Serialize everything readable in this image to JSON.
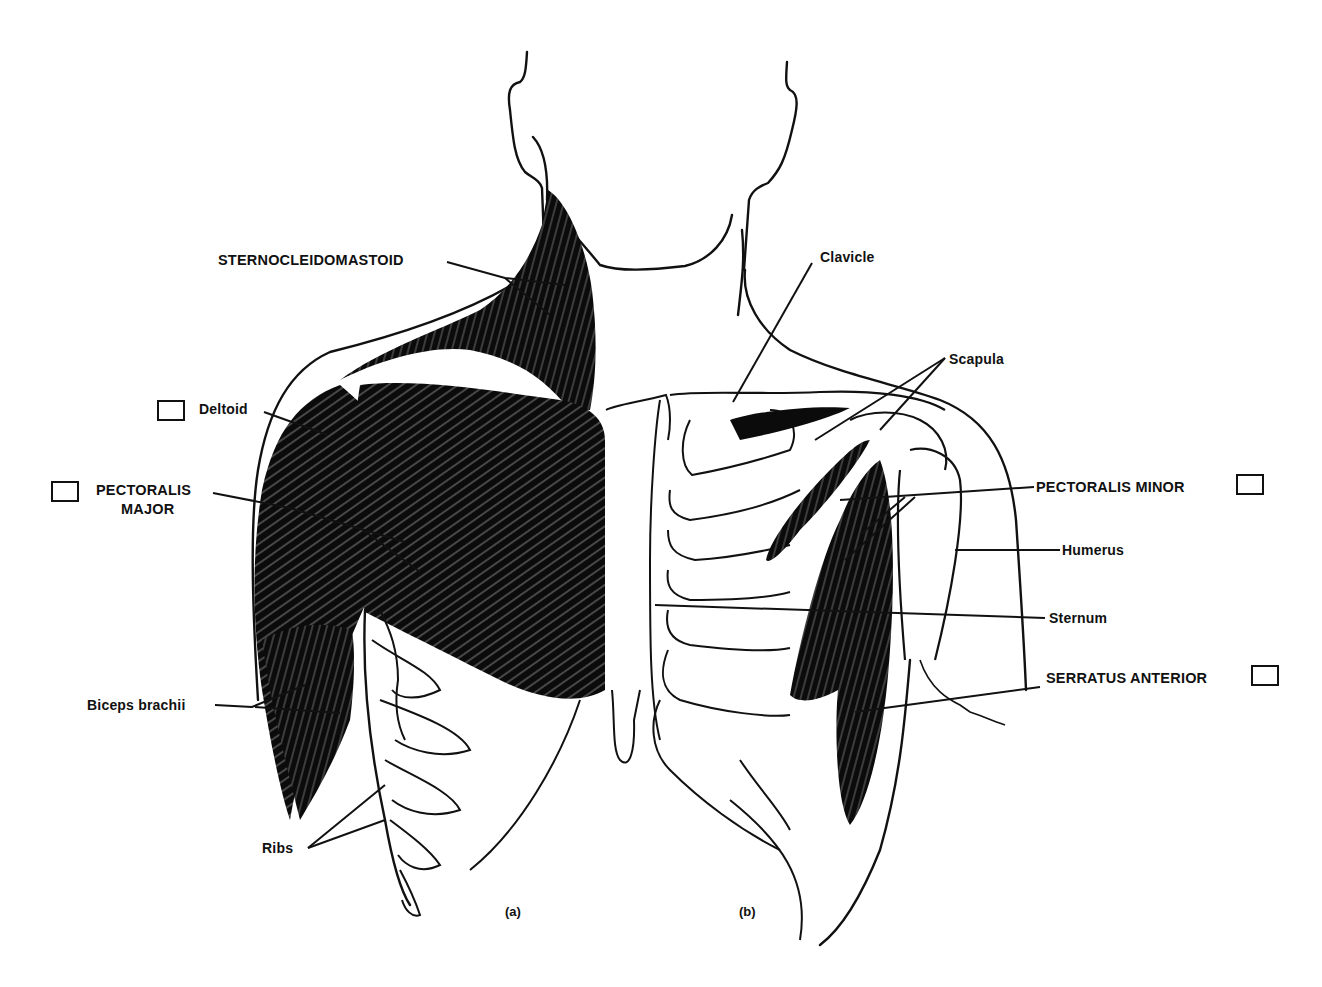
{
  "figure": {
    "panels": [
      {
        "id": "a",
        "caption": "(a)"
      },
      {
        "id": "b",
        "caption": "(b)"
      }
    ]
  },
  "labels": {
    "sternocleidomastoid": "STERNOCLEIDOMASTOID",
    "deltoid": "Deltoid",
    "pectoralis_major_line1": "PECTORALIS",
    "pectoralis_major_line2": "MAJOR",
    "biceps_brachii": "Biceps brachii",
    "ribs": "Ribs",
    "clavicle": "Clavicle",
    "scapula": "Scapula",
    "pectoralis_minor": "PECTORALIS MINOR",
    "humerus": "Humerus",
    "sternum": "Sternum",
    "serratus_anterior": "SERRATUS ANTERIOR"
  },
  "checkboxes": [
    {
      "for": "Deltoid",
      "checked": false
    },
    {
      "for": "PECTORALIS MAJOR",
      "checked": false
    },
    {
      "for": "PECTORALIS MINOR",
      "checked": false
    },
    {
      "for": "SERRATUS ANTERIOR",
      "checked": false
    }
  ],
  "colors": {
    "ink": "#111111",
    "paper": "#ffffff"
  }
}
